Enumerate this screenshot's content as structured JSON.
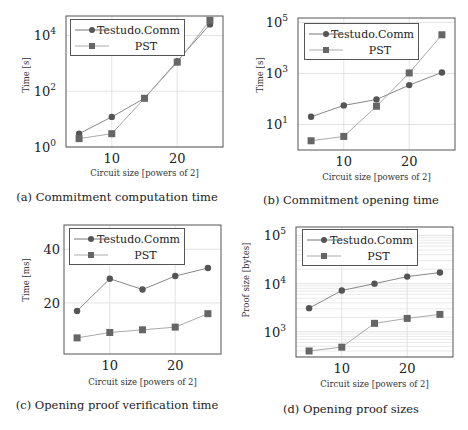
{
  "figure": {
    "panels": [
      {
        "id": "a",
        "caption": "(a) Commitment computation time",
        "xlabel": "Circuit size [powers of 2]",
        "ylabel": "Time [s]",
        "legend": [
          "Testudo.Comm",
          "PST"
        ]
      },
      {
        "id": "b",
        "caption": "(b) Commitment opening time",
        "xlabel": "Circuit size [powers of 2]",
        "ylabel": "Time [s]",
        "legend": [
          "Testudo.Comm",
          "PST"
        ]
      },
      {
        "id": "c",
        "caption": "(c) Opening proof verification time",
        "xlabel": "Circuit size [powers of 2]",
        "ylabel": "Time [ms]",
        "legend": [
          "Testudo.Comm",
          "PST"
        ]
      },
      {
        "id": "d",
        "caption": "(d) Opening proof sizes",
        "xlabel": "Circuit size [powers of 2]",
        "ylabel": "Proof size [bytes]",
        "legend": [
          "Testudo.Comm",
          "PST"
        ]
      }
    ]
  },
  "chart_data": [
    {
      "type": "line",
      "title": "(a) Commitment computation time",
      "xlabel": "Circuit size [powers of 2]",
      "ylabel": "Time [s]",
      "yscale": "log",
      "x": [
        5,
        10,
        15,
        20,
        25
      ],
      "xticks": [
        10,
        20
      ],
      "yticks": [
        "10^0",
        "10^2",
        "10^4"
      ],
      "ylim": [
        1,
        50000
      ],
      "grid": true,
      "legend_position": "upper left",
      "series": [
        {
          "name": "Testudo.Comm",
          "marker": "circle",
          "values": [
            3,
            12,
            56,
            1200,
            25000
          ]
        },
        {
          "name": "PST",
          "marker": "square",
          "values": [
            2,
            3,
            56,
            1100,
            35000
          ]
        }
      ]
    },
    {
      "type": "line",
      "title": "(b) Commitment opening time",
      "xlabel": "Circuit size [powers of 2]",
      "ylabel": "Time [s]",
      "yscale": "log",
      "x": [
        5,
        10,
        15,
        20,
        25
      ],
      "xticks": [
        10,
        20
      ],
      "yticks": [
        "10^1",
        "10^3",
        "10^5"
      ],
      "ylim": [
        1,
        150000
      ],
      "grid": true,
      "legend_position": "upper left",
      "series": [
        {
          "name": "Testudo.Comm",
          "marker": "circle",
          "values": [
            20,
            56,
            95,
            350,
            1100
          ]
        },
        {
          "name": "PST",
          "marker": "square",
          "values": [
            2.3,
            3.4,
            52,
            1050,
            33000
          ]
        }
      ]
    },
    {
      "type": "line",
      "title": "(c) Opening proof verification time",
      "xlabel": "Circuit size [powers of 2]",
      "ylabel": "Time [ms]",
      "yscale": "linear",
      "x": [
        5,
        10,
        15,
        20,
        25
      ],
      "xticks": [
        10,
        20
      ],
      "yticks": [
        20,
        40
      ],
      "ylim": [
        1,
        49
      ],
      "grid": true,
      "legend_position": "upper left",
      "series": [
        {
          "name": "Testudo.Comm",
          "marker": "circle",
          "values": [
            17,
            29,
            25,
            30,
            33
          ]
        },
        {
          "name": "PST",
          "marker": "square",
          "values": [
            7,
            9,
            10,
            11,
            16
          ]
        }
      ]
    },
    {
      "type": "line",
      "title": "(d) Opening proof sizes",
      "xlabel": "Circuit size [powers of 2]",
      "ylabel": "Proof size [bytes]",
      "yscale": "log",
      "x": [
        5,
        10,
        15,
        20,
        25
      ],
      "xticks": [
        10,
        20
      ],
      "yticks": [
        "10^3",
        "10^4",
        "10^5"
      ],
      "ylim": [
        300,
        150000
      ],
      "grid": true,
      "minor_grid": true,
      "legend_position": "upper left",
      "series": [
        {
          "name": "Testudo.Comm",
          "marker": "circle",
          "values": [
            3100,
            7200,
            10000,
            14000,
            17000
          ]
        },
        {
          "name": "PST",
          "marker": "square",
          "values": [
            400,
            480,
            1500,
            1900,
            2300
          ]
        }
      ]
    }
  ]
}
